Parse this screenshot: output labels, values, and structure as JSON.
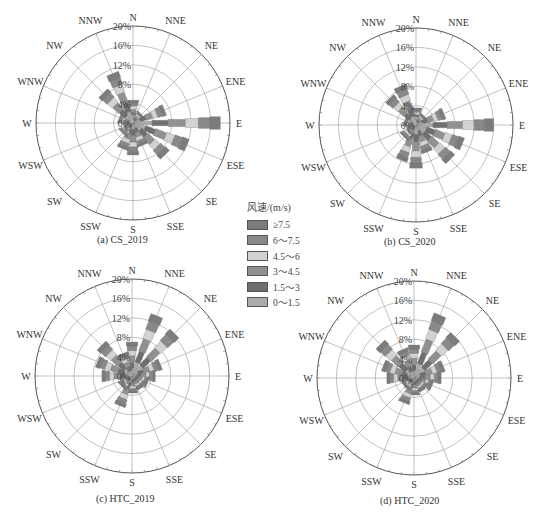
{
  "legend": {
    "title": "风速/(m/s)",
    "items": [
      {
        "label": "≥7.5",
        "color": "#7c7c7c"
      },
      {
        "label": "6～7.5",
        "color": "#898989"
      },
      {
        "label": "4.5～6",
        "color": "#d2d2d2"
      },
      {
        "label": "3～4.5",
        "color": "#919191"
      },
      {
        "label": "1.5～3",
        "color": "#6f6f6f"
      },
      {
        "label": "0～1.5",
        "color": "#ababab"
      }
    ]
  },
  "chart_data": [
    {
      "type": "wind-rose",
      "title": "(a) CS_2019",
      "directions": [
        "N",
        "NNE",
        "NE",
        "ENE",
        "E",
        "ESE",
        "SE",
        "SSE",
        "S",
        "SSW",
        "SW",
        "WSW",
        "W",
        "WNW",
        "NW",
        "NNW"
      ],
      "radial_ticks": [
        "0%",
        "4%",
        "8%",
        "12%",
        "16%",
        "20%"
      ],
      "rlim": [
        0,
        20
      ],
      "values_percent": [
        4.7,
        2.0,
        2.5,
        7.0,
        18.0,
        12.0,
        9.3,
        5.0,
        6.6,
        5.7,
        3.0,
        2.0,
        1.5,
        3.0,
        8.7,
        11.0
      ]
    },
    {
      "type": "wind-rose",
      "title": "(b) CS_2020",
      "directions": [
        "N",
        "NNE",
        "NE",
        "ENE",
        "E",
        "ESE",
        "SE",
        "SSE",
        "S",
        "SSW",
        "SW",
        "WSW",
        "W",
        "WNW",
        "NW",
        "NNW"
      ],
      "radial_ticks": [
        "0%",
        "4%",
        "8%",
        "12%",
        "16%",
        "20%"
      ],
      "rlim": [
        0,
        20
      ],
      "values_percent": [
        3.5,
        2.0,
        2.5,
        6.2,
        16.0,
        10.3,
        10.0,
        6.0,
        8.9,
        7.8,
        3.5,
        2.0,
        1.5,
        2.5,
        7.7,
        8.6
      ]
    },
    {
      "type": "wind-rose",
      "title": "(c) HTC_2019",
      "directions": [
        "N",
        "NNE",
        "NE",
        "ENE",
        "E",
        "ESE",
        "SE",
        "SSE",
        "S",
        "SSW",
        "SW",
        "WSW",
        "W",
        "WNW",
        "NW",
        "NNW"
      ],
      "radial_ticks": [
        "0%",
        "4%",
        "8%",
        "12%",
        "16%",
        "20%"
      ],
      "rlim": [
        0,
        20
      ],
      "values_percent": [
        7.0,
        13.4,
        12.4,
        6.3,
        4.8,
        3.5,
        3.0,
        3.0,
        3.5,
        6.6,
        3.0,
        2.5,
        6.2,
        7.7,
        8.9,
        5.0
      ]
    },
    {
      "type": "wind-rose",
      "title": "(d) HTC_2020",
      "directions": [
        "N",
        "NNE",
        "NE",
        "ENE",
        "E",
        "ESE",
        "SE",
        "SSE",
        "S",
        "SSW",
        "SW",
        "WSW",
        "W",
        "WNW",
        "NW",
        "NNW"
      ],
      "radial_ticks": [
        "0%",
        "4%",
        "8%",
        "12%",
        "16%",
        "20%"
      ],
      "rlim": [
        0,
        20
      ],
      "values_percent": [
        6.8,
        14.0,
        12.0,
        6.5,
        5.6,
        4.0,
        3.0,
        3.0,
        3.5,
        5.5,
        2.5,
        2.5,
        5.6,
        6.8,
        9.8,
        6.3
      ]
    }
  ],
  "panels": [
    {
      "caption": "(a) CS_2019",
      "cx": 133,
      "cy": 123,
      "caption_x": 97,
      "caption_y": 241
    },
    {
      "caption": "(b) CS_2020",
      "cx": 416,
      "cy": 125,
      "caption_x": 384,
      "caption_y": 243
    },
    {
      "caption": "(c) HTC_2019",
      "cx": 132,
      "cy": 376,
      "caption_x": 96,
      "caption_y": 500
    },
    {
      "caption": "(d) HTC_2020",
      "cx": 414,
      "cy": 378,
      "caption_x": 380,
      "caption_y": 502
    }
  ]
}
